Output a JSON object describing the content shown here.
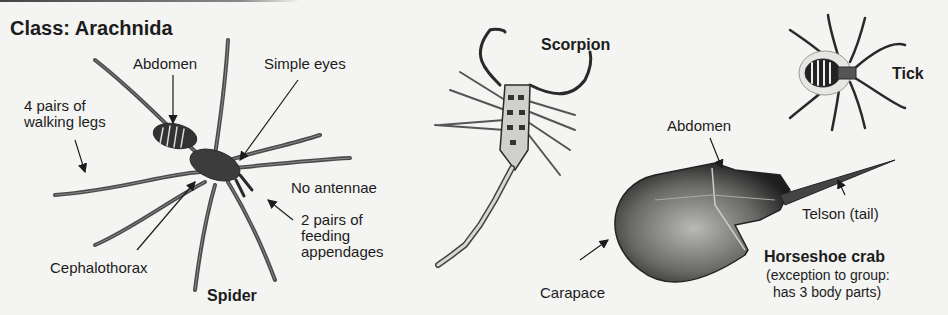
{
  "title": "Class: Arachnida",
  "colors": {
    "background": "#f4f4f2",
    "ink": "#1c1c1c",
    "shade": "#3a3a3a"
  },
  "spider": {
    "name": "Spider",
    "labels": {
      "abdomen": "Abdomen",
      "simple_eyes": "Simple eyes",
      "walking_legs_line1": "4 pairs of",
      "walking_legs_line2": "walking legs",
      "no_antennae": "No antennae",
      "feeding_line1": "2 pairs of",
      "feeding_line2": "feeding",
      "feeding_line3": "appendages",
      "cephalothorax": "Cephalothorax"
    }
  },
  "scorpion": {
    "name": "Scorpion"
  },
  "tick": {
    "name": "Tick"
  },
  "horseshoe_crab": {
    "name": "Horseshoe crab",
    "note_line1": "(exception to group:",
    "note_line2": "has 3 body parts)",
    "labels": {
      "abdomen": "Abdomen",
      "telson": "Telson (tail)",
      "carapace": "Carapace"
    }
  }
}
